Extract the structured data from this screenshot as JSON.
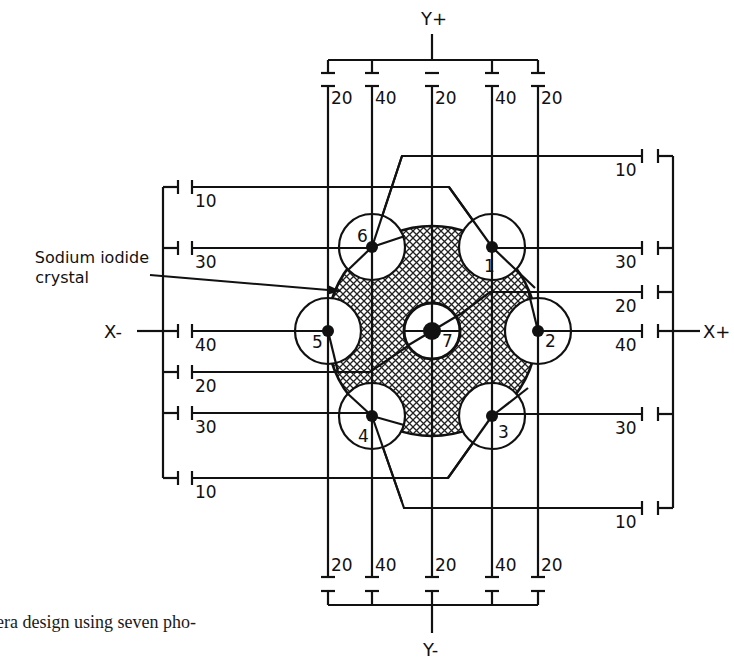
{
  "figure": {
    "caption_fragment": "era design using seven pho-",
    "crystal_label_line1": "Sodium iodide",
    "crystal_label_line2": "crystal",
    "axis_labels": {
      "y_plus": "Y+",
      "y_minus": "Y-",
      "x_minus": "X-",
      "x_plus": "X+"
    },
    "colors": {
      "ink": "#111111",
      "crystal_fill": "#bdbdbd",
      "background": "#ffffff"
    },
    "crystal": {
      "cx": 432,
      "cy": 331,
      "r": 105
    },
    "pmts": [
      {
        "id": "1",
        "cx": 492,
        "cy": 247,
        "r": 33
      },
      {
        "id": "2",
        "cx": 538,
        "cy": 331,
        "r": 33
      },
      {
        "id": "3",
        "cx": 492,
        "cy": 416,
        "r": 33
      },
      {
        "id": "4",
        "cx": 372,
        "cy": 416,
        "r": 33
      },
      {
        "id": "5",
        "cx": 328,
        "cy": 331,
        "r": 33
      },
      {
        "id": "6",
        "cx": 372,
        "cy": 247,
        "r": 33
      },
      {
        "id": "7",
        "cx": 432,
        "cy": 331,
        "r": 28
      }
    ],
    "y_columns": [
      {
        "x": 328,
        "top_weight": "20",
        "bottom_weight": "20"
      },
      {
        "x": 372,
        "top_weight": "40",
        "bottom_weight": "40"
      },
      {
        "x": 432,
        "top_weight": "20",
        "bottom_weight": "20"
      },
      {
        "x": 492,
        "top_weight": "40",
        "bottom_weight": "40"
      },
      {
        "x": 538,
        "top_weight": "20",
        "bottom_weight": "20"
      }
    ],
    "x_minus_rows": [
      {
        "y": 187,
        "weight": "10"
      },
      {
        "y": 248,
        "weight": "30"
      },
      {
        "y": 331,
        "weight": "40"
      },
      {
        "y": 372,
        "weight": "20"
      },
      {
        "y": 413,
        "weight": "30"
      },
      {
        "y": 478,
        "weight": "10"
      }
    ],
    "x_plus_rows": [
      {
        "y": 156,
        "weight": "10"
      },
      {
        "y": 248,
        "weight": "30"
      },
      {
        "y": 292,
        "weight": "20"
      },
      {
        "y": 331,
        "weight": "40"
      },
      {
        "y": 414,
        "weight": "30"
      },
      {
        "y": 508,
        "weight": "10"
      }
    ]
  }
}
